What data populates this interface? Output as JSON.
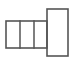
{
  "figure": {
    "kind": "line-diagram",
    "canvas": {
      "width": 73,
      "height": 63,
      "background": "#ffffff"
    },
    "style": {
      "stroke_color": "#555555",
      "fill_color": "#ffffff",
      "stroke_width": 1.6
    },
    "shapes": [
      {
        "id": "main-bar",
        "name": "main-horizontal-bar",
        "type": "rect",
        "x": 6,
        "y": 21,
        "width": 41,
        "height": 27
      },
      {
        "id": "tall-panel",
        "name": "tall-right-panel",
        "type": "rect",
        "x": 47,
        "y": 9,
        "width": 21,
        "height": 47
      }
    ],
    "dividers": [
      {
        "id": "divider-1",
        "name": "vertical-divider-left",
        "x": 20,
        "y1": 21,
        "y2": 48
      },
      {
        "id": "divider-2",
        "name": "vertical-divider-right",
        "x": 34,
        "y1": 21,
        "y2": 48
      }
    ],
    "cells": [
      {
        "id": "cell-1",
        "label": ""
      },
      {
        "id": "cell-2",
        "label": ""
      },
      {
        "id": "cell-3",
        "label": ""
      },
      {
        "id": "cell-4",
        "label": ""
      }
    ]
  }
}
